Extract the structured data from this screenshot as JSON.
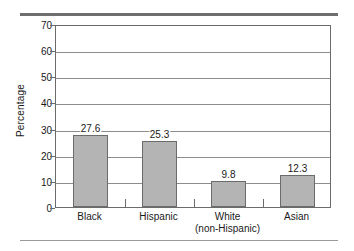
{
  "chart_data": {
    "type": "bar",
    "title": "",
    "subtitle": "",
    "xlabel": "",
    "ylabel": "Percentage",
    "categories": [
      "Black",
      "Hispanic",
      "White\n(non-Hispanic)",
      "Asian"
    ],
    "category_lines": [
      [
        "Black"
      ],
      [
        "Hispanic"
      ],
      [
        "White",
        "(non-Hispanic)"
      ],
      [
        "Asian"
      ]
    ],
    "values": [
      27.6,
      25.3,
      9.8,
      12.3
    ],
    "value_labels": [
      "27.6",
      "25.3",
      "9.8",
      "12.3"
    ],
    "ylim": [
      0,
      70
    ],
    "ytick_values": [
      0,
      10,
      20,
      30,
      40,
      50,
      60,
      70
    ],
    "ytick_labels": [
      "0",
      "10",
      "20",
      "30",
      "40",
      "50",
      "60",
      "70"
    ],
    "grid": true,
    "grid_axis": "y",
    "legend": null,
    "legend_position": "none",
    "bar_fill_color": "#b4b4b4",
    "bar_edge_color": "#6b6b6b",
    "grid_color": "#8d8d8d",
    "axis_color": "#6b6b6b",
    "background_color": "#ffffff",
    "text_color": "#1a1a1a"
  },
  "decorations": {
    "top_rule_color": "#6e6e6e",
    "bottom_rule_color": "#9a9a9a"
  }
}
